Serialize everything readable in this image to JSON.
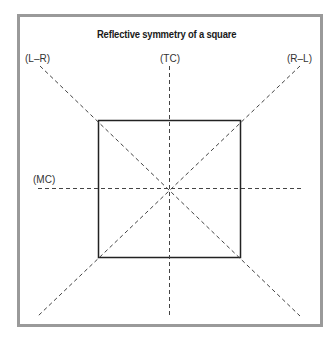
{
  "title": "Reflective symmetry of a square",
  "axes": {
    "left_to_right": "(L–R)",
    "top_center": "(TC)",
    "right_to_left": "(R–L)",
    "middle_center": "(MC)"
  },
  "colors": {
    "frame": "#9a9a9a",
    "square": "#222222",
    "axis_lines": "#444444",
    "text": "#1a1a1a"
  }
}
